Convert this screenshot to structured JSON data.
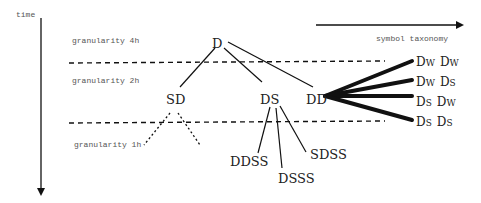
{
  "axes": {
    "time_label": "time",
    "taxonomy_label": "symbol taxonomy"
  },
  "granularities": [
    {
      "label": "granularity 4h"
    },
    {
      "label": "granularity 2h"
    },
    {
      "label": "granularity 1h"
    }
  ],
  "tree": {
    "root": "D",
    "level2": [
      "SD",
      "DS",
      "DD"
    ],
    "level3_from_DS": [
      "DDSS",
      "DSSS",
      "SDSS"
    ]
  },
  "dd_expansions": [
    {
      "first": "D",
      "first_sub": "W",
      "second": "D",
      "second_sub": "W"
    },
    {
      "first": "D",
      "first_sub": "W",
      "second": "D",
      "second_sub": "S"
    },
    {
      "first": "D",
      "first_sub": "S",
      "second": "D",
      "second_sub": "W"
    },
    {
      "first": "D",
      "first_sub": "S",
      "second": "D",
      "second_sub": "S"
    }
  ],
  "colors": {
    "line": "#111111",
    "text": "#222222",
    "label": "#555555"
  }
}
